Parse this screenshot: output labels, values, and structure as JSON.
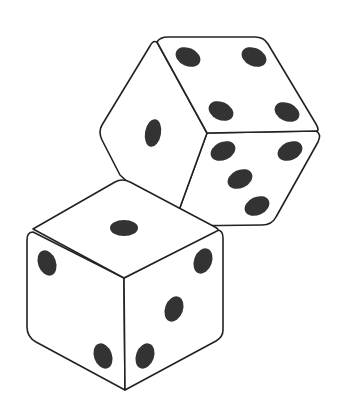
{
  "image": {
    "subject": "two dice illustration",
    "background": "#ffffff",
    "ink": "#222222",
    "pip_color": "#333333"
  },
  "dice": [
    {
      "name": "back-die",
      "top_face_pips": 4,
      "left_face_pips": 1,
      "right_face_pips": 5
    },
    {
      "name": "front-die",
      "top_face_pips": 1,
      "left_face_pips": 2,
      "right_face_pips": 3
    }
  ]
}
